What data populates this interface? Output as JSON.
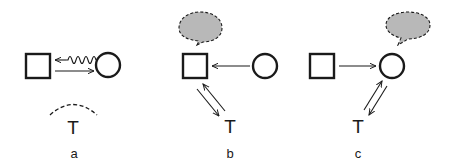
{
  "diagram": {
    "colors": {
      "stroke": "#1a1a1a",
      "bubble_fill": "#b8b8b8",
      "background": "#ffffff"
    },
    "panels": [
      {
        "id": "a",
        "caption": "a",
        "third_party_label": "T",
        "nodes": [
          "square",
          "circle"
        ],
        "edges": [
          {
            "from": "circle",
            "to": "square",
            "style": "wavy"
          },
          {
            "from": "square",
            "to": "circle",
            "style": "straight"
          }
        ],
        "third_party_marker": "dashed-arc"
      },
      {
        "id": "b",
        "caption": "b",
        "third_party_label": "T",
        "nodes": [
          "square",
          "circle"
        ],
        "edges": [
          {
            "from": "circle",
            "to": "square",
            "style": "straight"
          },
          {
            "from": "square",
            "to": "T",
            "style": "straight"
          },
          {
            "from": "T",
            "to": "square",
            "style": "straight"
          }
        ],
        "thought_bubble_on": "square"
      },
      {
        "id": "c",
        "caption": "c",
        "third_party_label": "T",
        "nodes": [
          "square",
          "circle"
        ],
        "edges": [
          {
            "from": "square",
            "to": "circle",
            "style": "straight"
          },
          {
            "from": "circle",
            "to": "T",
            "style": "straight"
          },
          {
            "from": "T",
            "to": "circle",
            "style": "straight"
          }
        ],
        "thought_bubble_on": "circle"
      }
    ]
  }
}
